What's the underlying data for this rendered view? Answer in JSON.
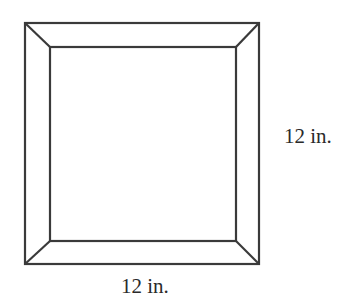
{
  "diagram": {
    "labels": {
      "right_side": "12 in.",
      "bottom_side": "12 in."
    },
    "outer_square": {
      "x1": 25,
      "y1": 23,
      "x2": 259,
      "y2": 264
    },
    "inner_square": {
      "x1": 50,
      "y1": 47,
      "x2": 236,
      "y2": 241
    },
    "stroke_color": "#3a3a3a"
  }
}
